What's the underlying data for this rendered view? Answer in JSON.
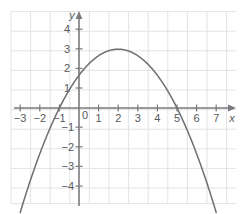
{
  "figure": {
    "background": "#ffffff",
    "grid_color": "#e3e3e5",
    "axis_color": "#7a7a7e",
    "curve_color": "#6e6e72",
    "label_color": "#58595b",
    "axis_label_x": "x",
    "axis_label_y": "y"
  },
  "chart_data": {
    "type": "line",
    "title": "",
    "xlabel": "x",
    "ylabel": "y",
    "grid": true,
    "legend": "none",
    "xlim": [
      -3.5,
      7.6
    ],
    "ylim": [
      -5.0,
      4.9
    ],
    "xticks": [
      -3,
      -2,
      -1,
      0,
      1,
      2,
      3,
      4,
      5,
      6,
      7
    ],
    "yticks": [
      -4,
      -3,
      -2,
      -1,
      1,
      2,
      3,
      4
    ],
    "xtick_labels": [
      "−3",
      "−2",
      "−1",
      "0",
      "1",
      "2",
      "3",
      "4",
      "5",
      "6",
      "7"
    ],
    "ytick_labels": [
      "−4",
      "−3",
      "−2",
      "−1",
      "1",
      "2",
      "3",
      "4"
    ],
    "series": [
      {
        "name": "parabola",
        "equation": "y = -(1/3)(x + 1)(x - 5)",
        "vertex": [
          2,
          3
        ],
        "roots": [
          -1,
          5
        ],
        "y_intercept": 1.667,
        "opens": "down",
        "x": [
          -2.6,
          -2.4,
          -2.2,
          -2.0,
          -1.8,
          -1.6,
          -1.4,
          -1.2,
          -1.0,
          -0.8,
          -0.6,
          -0.4,
          -0.2,
          0.0,
          0.2,
          0.4,
          0.6,
          0.8,
          1.0,
          1.2,
          1.4,
          1.6,
          1.8,
          2.0,
          2.2,
          2.4,
          2.6,
          2.8,
          3.0,
          3.2,
          3.4,
          3.6,
          3.8,
          4.0,
          4.2,
          4.4,
          4.6,
          4.8,
          5.0,
          5.2,
          5.4,
          5.6,
          5.8,
          6.0,
          6.2,
          6.4,
          6.6
        ],
        "y": [
          -4.32,
          -3.65,
          -3.04,
          -2.33,
          -1.79,
          -1.28,
          -0.8,
          -0.35,
          0.0,
          0.48,
          0.75,
          1.08,
          1.39,
          1.67,
          1.92,
          2.16,
          2.37,
          2.56,
          2.67,
          2.83,
          2.92,
          2.99,
          2.99,
          3.0,
          2.99,
          2.95,
          2.88,
          2.78,
          2.67,
          2.52,
          2.36,
          2.16,
          1.95,
          1.67,
          1.41,
          1.12,
          0.8,
          0.45,
          0.0,
          -0.41,
          -0.85,
          -1.32,
          -1.82,
          -2.33,
          -2.9,
          -3.48,
          -4.09
        ]
      }
    ]
  }
}
